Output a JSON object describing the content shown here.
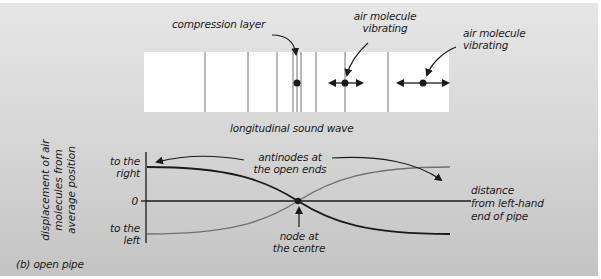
{
  "figure": {
    "caption": "(b) open pipe",
    "top_diagram": {
      "title": "longitudinal sound wave",
      "labels": {
        "compression": "compression layer",
        "molecule_1": [
          "air molecule",
          "vibrating"
        ],
        "molecule_2": [
          "air molecule",
          "vibrating"
        ]
      },
      "wave_lines_x": [
        205,
        248,
        277,
        293,
        297,
        301,
        316,
        345,
        388
      ]
    },
    "graph": {
      "y_axis_label": [
        "displacement of air",
        "molecules from",
        "average position"
      ],
      "y_ticks": {
        "top": [
          "to the",
          "right"
        ],
        "zero": "0",
        "bottom": [
          "to the",
          "left"
        ]
      },
      "x_axis_label": [
        "distance",
        "from left-hand",
        "end of pipe"
      ],
      "annotations": {
        "antinodes": [
          "antinodes at",
          "the open ends"
        ],
        "node": [
          "node at",
          "the centre"
        ]
      }
    }
  },
  "colors": {
    "line_dark": "#1a1a1a",
    "line_gray": "#707070",
    "box_fill": "#ffffff",
    "panel_top": "#e6e6e6",
    "panel_bottom": "#c4c4c4"
  }
}
